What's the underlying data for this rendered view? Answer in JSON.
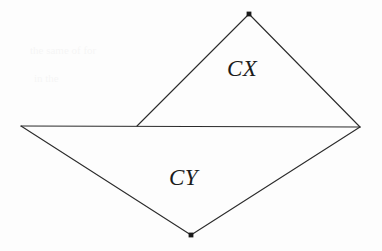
{
  "figure": {
    "background_color": "#fdfdfd",
    "stroke_color": "#2b2b2b",
    "stroke_width": 1.1,
    "width": 382,
    "height": 251,
    "vertices": {
      "top_apex": {
        "name": "top-apex",
        "x": 249,
        "y": 14,
        "marker": "dot"
      },
      "left": {
        "name": "left-vertex",
        "x": 21,
        "y": 126,
        "marker": "none"
      },
      "right": {
        "name": "right-vertex",
        "x": 360,
        "y": 127,
        "marker": "none"
      },
      "bottom_apex": {
        "name": "bottom-apex",
        "x": 191,
        "y": 235,
        "marker": "dot"
      },
      "mid_junction": {
        "name": "mid-junction",
        "x": 137,
        "y": 126,
        "marker": "none"
      }
    },
    "edges": [
      {
        "name": "horizontal-baseline",
        "from": "left",
        "to": "right"
      },
      {
        "name": "upper-left-edge",
        "from": "mid_junction",
        "to": "top_apex"
      },
      {
        "name": "upper-right-edge",
        "from": "top_apex",
        "to": "right"
      },
      {
        "name": "lower-left-edge",
        "from": "left",
        "to": "bottom_apex"
      },
      {
        "name": "lower-right-edge",
        "from": "bottom_apex",
        "to": "right"
      }
    ],
    "markers": [
      {
        "name": "top-apex-dot",
        "x": 249,
        "y": 14,
        "size": 3.2
      },
      {
        "name": "bottom-apex-dot",
        "x": 191,
        "y": 235,
        "size": 3.2
      }
    ],
    "labels": {
      "upper_region": "CX",
      "lower_region": "CY"
    },
    "noise": {
      "ghost_line_1": "the  same  of  for",
      "ghost_line_2": "in  the"
    }
  }
}
